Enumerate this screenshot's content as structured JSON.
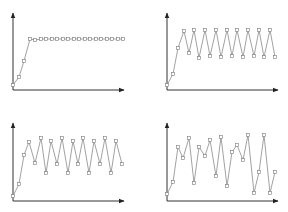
{
  "colors": {
    "axis": "#333333",
    "line": "#8a8a8a",
    "marker_stroke": "#7a7a7a",
    "background": "#ffffff"
  },
  "chart_data": [
    {
      "id": "top-left",
      "type": "line",
      "title": "",
      "xlabel": "",
      "ylabel": "",
      "grid": false,
      "legend": null,
      "marker": "square",
      "description": "rises quickly then stays flat (converges)",
      "axes": {
        "origin": [
          13,
          90
        ],
        "x_end": 124,
        "y_end": 13
      },
      "points": [
        [
          13,
          85
        ],
        [
          19,
          77
        ],
        [
          24,
          61
        ],
        [
          30,
          39
        ],
        [
          35,
          40
        ],
        [
          41,
          39
        ],
        [
          46,
          39
        ],
        [
          52,
          39
        ],
        [
          57,
          39
        ],
        [
          63,
          39
        ],
        [
          68,
          39
        ],
        [
          74,
          39
        ],
        [
          79,
          39
        ],
        [
          85,
          39
        ],
        [
          90,
          39
        ],
        [
          96,
          39
        ],
        [
          101,
          39
        ],
        [
          107,
          39
        ],
        [
          112,
          39
        ],
        [
          118,
          39
        ],
        [
          123,
          39
        ]
      ],
      "values": [
        1,
        2.5,
        5.5,
        9.5,
        9.3,
        9.5,
        9.5,
        9.5,
        9.5,
        9.5,
        9.5,
        9.5,
        9.5,
        9.5,
        9.5,
        9.5,
        9.5,
        9.5,
        9.5,
        9.5,
        9.5
      ]
    },
    {
      "id": "top-right",
      "type": "line",
      "title": "",
      "xlabel": "",
      "ylabel": "",
      "grid": false,
      "legend": null,
      "marker": "square",
      "description": "rises then oscillates regularly between two levels (period-2)",
      "axes": {
        "origin": [
          167,
          90
        ],
        "x_end": 278,
        "y_end": 13
      },
      "points": [
        [
          167,
          85
        ],
        [
          173,
          74
        ],
        [
          178,
          48
        ],
        [
          184,
          31
        ],
        [
          189,
          53
        ],
        [
          194,
          30
        ],
        [
          199,
          58
        ],
        [
          205,
          30
        ],
        [
          210,
          56
        ],
        [
          216,
          30
        ],
        [
          221,
          57
        ],
        [
          227,
          30
        ],
        [
          232,
          56
        ],
        [
          237,
          30
        ],
        [
          243,
          57
        ],
        [
          248,
          30
        ],
        [
          254,
          56
        ],
        [
          259,
          30
        ],
        [
          264,
          57
        ],
        [
          270,
          30
        ],
        [
          275,
          57
        ]
      ],
      "values": [
        1,
        3,
        7.5,
        10.5,
        6.5,
        10.7,
        5.8,
        10.7,
        6.2,
        10.7,
        6,
        10.7,
        6.2,
        10.7,
        6,
        10.7,
        6.2,
        10.7,
        6,
        10.7,
        6
      ]
    },
    {
      "id": "bottom-left",
      "type": "line",
      "title": "",
      "xlabel": "",
      "ylabel": "",
      "grid": false,
      "legend": null,
      "marker": "square",
      "description": "rises then oscillates among four levels (period-4)",
      "axes": {
        "origin": [
          13,
          201
        ],
        "x_end": 124,
        "y_end": 123
      },
      "points": [
        [
          13,
          196
        ],
        [
          19,
          184
        ],
        [
          24,
          155
        ],
        [
          29,
          142
        ],
        [
          35,
          163
        ],
        [
          41,
          138
        ],
        [
          46,
          173
        ],
        [
          51,
          141
        ],
        [
          57,
          164
        ],
        [
          62,
          138
        ],
        [
          68,
          173
        ],
        [
          73,
          141
        ],
        [
          78,
          164
        ],
        [
          83,
          138
        ],
        [
          89,
          173
        ],
        [
          94,
          141
        ],
        [
          100,
          164
        ],
        [
          105,
          138
        ],
        [
          111,
          173
        ],
        [
          116,
          141
        ],
        [
          122,
          164
        ]
      ],
      "values": [
        1,
        3,
        8,
        10.3,
        6.7,
        11,
        5,
        10.5,
        6.5,
        11,
        5,
        10.5,
        6.5,
        11,
        5,
        10.5,
        6.5,
        11,
        5,
        10.5,
        6.5
      ]
    },
    {
      "id": "bottom-right",
      "type": "line",
      "title": "",
      "xlabel": "",
      "ylabel": "",
      "grid": false,
      "legend": null,
      "marker": "square",
      "description": "rises then fluctuates irregularly (chaotic)",
      "axes": {
        "origin": [
          167,
          201
        ],
        "x_end": 278,
        "y_end": 123
      },
      "points": [
        [
          167,
          194
        ],
        [
          173,
          182
        ],
        [
          178,
          147
        ],
        [
          183,
          158
        ],
        [
          189,
          138
        ],
        [
          194,
          183
        ],
        [
          199,
          147
        ],
        [
          205,
          156
        ],
        [
          210,
          140
        ],
        [
          216,
          176
        ],
        [
          221,
          137
        ],
        [
          227,
          186
        ],
        [
          232,
          152
        ],
        [
          237,
          145
        ],
        [
          243,
          160
        ],
        [
          248,
          135
        ],
        [
          254,
          193
        ],
        [
          259,
          172
        ],
        [
          264,
          135
        ],
        [
          270,
          193
        ],
        [
          275,
          172
        ]
      ],
      "values": [
        1,
        3,
        9,
        7,
        10.5,
        3,
        9,
        7.5,
        10,
        4.5,
        10.8,
        2.5,
        8.5,
        9.5,
        7,
        11,
        1.5,
        5,
        11,
        1.5,
        5
      ]
    }
  ]
}
